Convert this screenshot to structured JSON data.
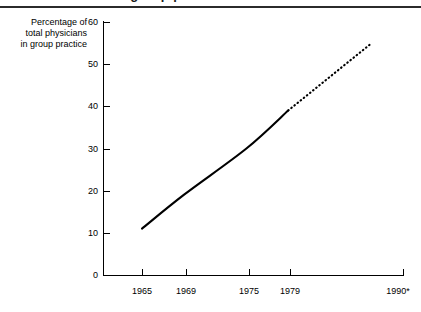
{
  "header": {
    "clipped_title": "Growth of group practice in the United States"
  },
  "axes": {
    "y_caption_lines": [
      "Percentage of",
      "total physicians",
      "in group practice"
    ],
    "y_ticks": [
      "60",
      "50",
      "40",
      "30",
      "20",
      "10",
      "0"
    ],
    "x_ticks": [
      "1965",
      "1969",
      "1975",
      "1979",
      "1990*"
    ]
  },
  "chart_data": {
    "type": "line",
    "title": "Growth of group practice in the United States",
    "xlabel": "",
    "ylabel": "Percentage of total physicians in group practice",
    "ylim": [
      0,
      60
    ],
    "ytick_values": [
      0,
      10,
      20,
      30,
      40,
      50,
      60
    ],
    "xtick_labels": [
      "1965",
      "1969",
      "1975",
      "1979",
      "1990*"
    ],
    "xtick_values": [
      1965,
      1969,
      1975,
      1979,
      1990
    ],
    "grid": false,
    "legend": "none",
    "series": [
      {
        "name": "Actual (observed)",
        "style": "solid",
        "x": [
          1965,
          1969,
          1975,
          1979
        ],
        "values": [
          11,
          19,
          30,
          39
        ]
      },
      {
        "name": "Projected",
        "style": "dotted",
        "x": [
          1979,
          1987
        ],
        "values": [
          39,
          55
        ]
      }
    ],
    "annotations": [
      "Solid line shows observed percentage from 1965 to 1979.",
      "Dotted line shows the projection beyond 1979 toward 1990.",
      "* 1990 value is a projection."
    ]
  }
}
